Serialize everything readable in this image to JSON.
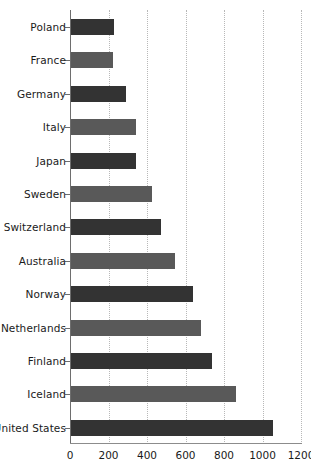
{
  "chart_data": {
    "type": "bar",
    "orientation": "horizontal",
    "title": "",
    "subtitle": "",
    "xlabel": "",
    "ylabel": "",
    "xlim": [
      0,
      1200
    ],
    "xticks": [
      0,
      200,
      400,
      600,
      800,
      1000,
      1200
    ],
    "xtick_labels": [
      "0",
      "200",
      "400",
      "600",
      "800",
      "1000",
      "1200"
    ],
    "grid": true,
    "grid_axis": "x",
    "grid_style": "dotted",
    "legend": false,
    "legend_position": "none",
    "categories": [
      "Poland",
      "France",
      "Germany",
      "Italy",
      "Japan",
      "Sweden",
      "Switzerland",
      "Australia",
      "Norway",
      "Netherlands",
      "Finland",
      "Iceland",
      "United States"
    ],
    "values": [
      225,
      220,
      285,
      340,
      340,
      420,
      465,
      540,
      635,
      675,
      735,
      855,
      1050
    ],
    "bar_colors": [
      "#333333",
      "#595959",
      "#333333",
      "#595959",
      "#333333",
      "#595959",
      "#333333",
      "#595959",
      "#333333",
      "#595959",
      "#333333",
      "#595959",
      "#333333"
    ],
    "colors": {
      "dark": "#333333",
      "medium": "#595959",
      "axis": "#6e6e6e",
      "grid": "#b8b8b8",
      "text": "#1a1a1a",
      "background": "#ffffff"
    }
  }
}
